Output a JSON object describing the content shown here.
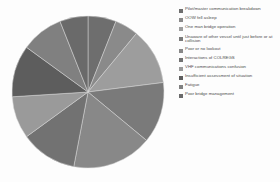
{
  "chart_data": {
    "type": "pie",
    "title": "",
    "subtitle": "",
    "xlabel": "",
    "ylabel": "",
    "legend_position": "right",
    "grid": false,
    "categories": [
      "Pilot/master communication breakdown",
      "OOW fell asleep",
      "One man bridge operation",
      "Unaware of other vessel until just before or at collision",
      "Poor or no lookout",
      "Interactions of COLREGS",
      "VHF communications confusion",
      "Insufficient assessment of situation",
      "Fatigue",
      "Poor bridge management"
    ],
    "values": [
      6,
      5,
      12,
      13,
      17,
      12,
      9,
      11,
      9,
      6
    ],
    "colors": [
      "#6e6e6e",
      "#8a8a8a",
      "#9d9d9d",
      "#7a7a7a",
      "#888888",
      "#727272",
      "#9a9a9a",
      "#5d5d5d",
      "#808080",
      "#6a6a6a"
    ]
  },
  "legend": {
    "items": [
      {
        "label": "Pilot/master communication breakdown",
        "color": "#6e6e6e"
      },
      {
        "label": "OOW fell asleep",
        "color": "#8a8a8a"
      },
      {
        "label": "One man bridge operation",
        "color": "#9d9d9d"
      },
      {
        "label": "Unaware of other vessel until just before or at collision",
        "color": "#7a7a7a"
      },
      {
        "label": "Poor or no lookout",
        "color": "#888888"
      },
      {
        "label": "Interactions of COLREGS",
        "color": "#727272"
      },
      {
        "label": "VHF communications confusion",
        "color": "#9a9a9a"
      },
      {
        "label": "Insufficient assessment of situation",
        "color": "#5d5d5d"
      },
      {
        "label": "Fatigue",
        "color": "#808080"
      },
      {
        "label": "Poor bridge management",
        "color": "#6a6a6a"
      }
    ]
  }
}
